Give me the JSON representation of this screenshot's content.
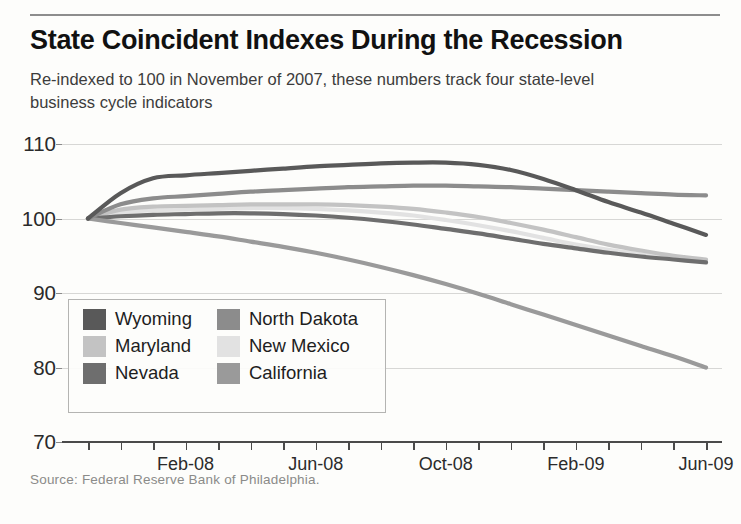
{
  "header": {
    "title": "State Coincident Indexes During the Recession",
    "subtitle": "Re-indexed to 100 in November of 2007, these numbers track four state-level business cycle indicators"
  },
  "source": {
    "text": "Source: Federal Reserve Bank of Philadelphia."
  },
  "legend": {
    "items": [
      {
        "label": "Wyoming",
        "color": "#595959"
      },
      {
        "label": "North Dakota",
        "color": "#8c8c8c"
      },
      {
        "label": "Maryland",
        "color": "#c3c3c3"
      },
      {
        "label": "New Mexico",
        "color": "#e2e2e2"
      },
      {
        "label": "Nevada",
        "color": "#6e6e6e"
      },
      {
        "label": "California",
        "color": "#9a9a9a"
      }
    ]
  },
  "chart_data": {
    "type": "line",
    "title": "State Coincident Indexes During the Recession",
    "subtitle": "Re-indexed to 100 in November of 2007, these numbers track four state-level business cycle indicators",
    "xlabel": "",
    "ylabel": "",
    "ylim": [
      70,
      110
    ],
    "yticks": [
      70,
      80,
      90,
      100,
      110
    ],
    "grid": true,
    "legend_position": "inside-lower-left",
    "x": [
      "Nov-07",
      "Dec-07",
      "Jan-08",
      "Feb-08",
      "Mar-08",
      "Apr-08",
      "May-08",
      "Jun-08",
      "Jul-08",
      "Aug-08",
      "Sep-08",
      "Oct-08",
      "Nov-08",
      "Dec-08",
      "Jan-09",
      "Feb-09",
      "Mar-09",
      "Apr-09",
      "May-09",
      "Jun-09"
    ],
    "xtick_labels": [
      {
        "x": "Feb-08",
        "index": 3
      },
      {
        "x": "Jun-08",
        "index": 7
      },
      {
        "x": "Oct-08",
        "index": 11
      },
      {
        "x": "Feb-09",
        "index": 15
      },
      {
        "x": "Jun-09",
        "index": 19
      }
    ],
    "series": [
      {
        "name": "Wyoming",
        "color": "#595959",
        "values": [
          100.0,
          103.4,
          105.4,
          105.8,
          106.1,
          106.4,
          106.7,
          107.0,
          107.2,
          107.4,
          107.5,
          107.5,
          107.2,
          106.5,
          105.3,
          103.8,
          102.2,
          100.8,
          99.3,
          97.8
        ]
      },
      {
        "name": "North Dakota",
        "color": "#8c8c8c",
        "values": [
          100.0,
          101.9,
          102.7,
          103.0,
          103.3,
          103.6,
          103.8,
          104.0,
          104.2,
          104.3,
          104.4,
          104.4,
          104.3,
          104.2,
          104.0,
          103.8,
          103.6,
          103.4,
          103.2,
          103.1
        ]
      },
      {
        "name": "Maryland",
        "color": "#c3c3c3",
        "values": [
          100.0,
          101.2,
          101.6,
          101.7,
          101.8,
          101.9,
          101.9,
          101.9,
          101.8,
          101.6,
          101.3,
          100.8,
          100.2,
          99.4,
          98.5,
          97.5,
          96.5,
          95.7,
          95.0,
          94.5
        ]
      },
      {
        "name": "New Mexico",
        "color": "#e2e2e2",
        "values": [
          100.0,
          100.8,
          101.1,
          101.2,
          101.3,
          101.4,
          101.4,
          101.3,
          101.1,
          100.8,
          100.4,
          99.8,
          99.1,
          98.3,
          97.4,
          96.5,
          95.8,
          95.2,
          94.7,
          94.3
        ]
      },
      {
        "name": "Nevada",
        "color": "#6e6e6e",
        "values": [
          100.0,
          100.3,
          100.5,
          100.6,
          100.7,
          100.7,
          100.6,
          100.4,
          100.1,
          99.7,
          99.2,
          98.6,
          98.0,
          97.3,
          96.6,
          96.0,
          95.4,
          94.9,
          94.5,
          94.1
        ]
      },
      {
        "name": "California",
        "color": "#9a9a9a",
        "values": [
          100.0,
          99.4,
          98.8,
          98.2,
          97.6,
          96.9,
          96.2,
          95.4,
          94.5,
          93.5,
          92.4,
          91.2,
          89.9,
          88.5,
          87.1,
          85.7,
          84.3,
          82.9,
          81.5,
          80.0
        ]
      }
    ]
  }
}
